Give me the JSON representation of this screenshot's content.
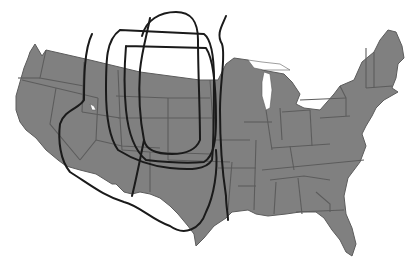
{
  "map": {
    "title": "",
    "subject": "Contiguous United States with overlaid regional boundary outlines (Great Plains delineations)",
    "colors": {
      "background": "#ffffff",
      "land_fill": "#808080",
      "state_border": "#5c5c5c",
      "boundary_line": "#1a1a1a",
      "lakes": "#ffffff"
    },
    "land_outline": "M 30,52 L 35,44 L 42,56 L 46,50 L 90,60 L 140,72 L 200,80 L 218,80 L 226,64 L 234,58 L 248,60 L 256,66 L 262,70 L 284,74 L 292,82 L 300,94 L 296,104 L 304,108 L 320,110 L 334,94 L 340,86 L 354,80 L 362,62 L 374,52 L 380,40 L 388,30 L 396,32 L 402,46 L 404,58 L 398,64 L 396,78 L 392,88 L 398,92 L 384,100 L 376,108 L 372,116 L 366,126 L 362,134 L 366,146 L 360,162 L 348,178 L 344,196 L 346,214 L 352,228 L 356,244 L 352,256 L 346,252 L 340,240 L 332,230 L 324,218 L 316,212 L 300,212 L 286,214 L 268,216 L 256,214 L 248,210 L 232,212 L 226,218 L 214,226 L 204,238 L 196,246 L 194,234 L 188,226 L 178,214 L 170,206 L 160,198 L 150,194 L 140,192 L 132,194 L 124,192 L 116,184 L 112,184 L 96,174 L 80,170 L 66,166 L 58,160 L 46,150 L 36,138 L 26,130 L 20,122 L 16,110 L 16,96 L 20,82 L 24,68 L 28,58 Z",
    "lakes": [
      {
        "name": "lake-superior",
        "path": "M 248,60 L 262,62 L 280,64 L 290,70 L 278,70 L 264,70 L 254,68 Z"
      },
      {
        "name": "lake-michigan",
        "path": "M 264,72 L 270,74 L 272,90 L 270,108 L 266,110 L 262,96 L 262,82 Z"
      },
      {
        "name": "great-salt-lake",
        "path": "M 90,104 L 94,106 L 96,110 L 92,110 Z"
      }
    ],
    "state_borders": [
      "M 46,50 L 40,78 L 84,86",
      "M 84,62 L 82,112",
      "M 40,78 L 18,78",
      "M 22,80 L 56,88 L 98,98",
      "M 56,88 L 50,124 L 80,160",
      "M 98,98 L 96,140 L 80,160",
      "M 82,112 L 120,118 L 122,150",
      "M 96,140 L 122,146 L 160,148",
      "M 120,118 L 118,70",
      "M 116,96 L 168,98 L 210,98",
      "M 118,118 L 170,118 L 216,118",
      "M 122,150 L 150,152 L 210,154",
      "M 168,98 L 168,160",
      "M 150,152 L 150,192",
      "M 168,160 L 230,162",
      "M 210,80 L 214,140",
      "M 216,140 L 250,140",
      "M 218,168 L 256,168",
      "M 238,186 L 256,186",
      "M 232,162 L 228,210",
      "M 256,140 L 254,210",
      "M 244,122 L 272,122",
      "M 266,110 L 272,150",
      "M 280,108 L 282,140",
      "M 282,112 L 310,110",
      "M 310,110 L 312,146",
      "M 300,100 L 346,98",
      "M 340,86 L 346,98 L 346,116",
      "M 320,118 L 350,116",
      "M 272,148 L 330,144",
      "M 290,146 L 294,170",
      "M 262,170 L 364,160",
      "M 270,180 L 304,176 L 330,180",
      "M 276,182 L 274,214",
      "M 298,178 L 302,214",
      "M 316,192 L 330,204 L 330,212",
      "M 296,212 L 344,210",
      "M 366,48 L 366,88",
      "M 374,52 L 374,88",
      "M 366,88 L 392,86"
    ],
    "boundary_curves": [
      {
        "id": "curve-1",
        "label": "western-outer-boundary",
        "path": "M 92,34 C 84,50 84,80 84,100 C 80,108 64,110 60,124 C 58,140 60,160 70,172 C 92,186 104,196 124,202 C 140,206 152,220 170,226 C 184,236 200,230 206,212 C 214,196 218,170 216,150"
      },
      {
        "id": "curve-2",
        "label": "inner-loop-a",
        "path": "M 120,30 L 204,34 C 212,40 214,60 214,80 C 214,110 214,140 212,160 C 206,170 190,170 170,168 C 150,166 134,160 118,150 C 108,136 106,110 106,90 C 106,60 106,40 120,30"
      },
      {
        "id": "curve-3",
        "label": "inner-loop-b",
        "path": "M 126,46 L 206,48 C 214,60 216,90 216,120 C 216,140 214,156 204,162 C 184,164 164,162 146,160 C 134,150 128,130 126,110 C 124,90 124,70 126,46"
      },
      {
        "id": "curve-4",
        "label": "northern-dome",
        "path": "M 142,36 C 146,20 160,12 176,12 C 192,12 198,22 198,40 C 198,70 200,110 200,140 C 196,150 186,154 172,154 C 156,154 146,150 144,140"
      },
      {
        "id": "curve-5",
        "label": "central-vertical",
        "path": "M 150,18 C 148,30 142,50 140,70 C 138,100 140,120 144,140 C 140,160 136,180 132,196"
      },
      {
        "id": "curve-6",
        "label": "eastern-vertical",
        "path": "M 226,16 C 222,26 216,34 222,44 C 226,56 220,80 220,110 C 220,140 222,170 226,196 C 226,206 228,214 228,220"
      }
    ],
    "markers": [
      {
        "name": "city-dot-new-orleans",
        "cx": 258,
        "cy": 225
      },
      {
        "name": "city-dot-florida",
        "cx": 338,
        "cy": 249
      }
    ],
    "clipped_caption": ""
  }
}
